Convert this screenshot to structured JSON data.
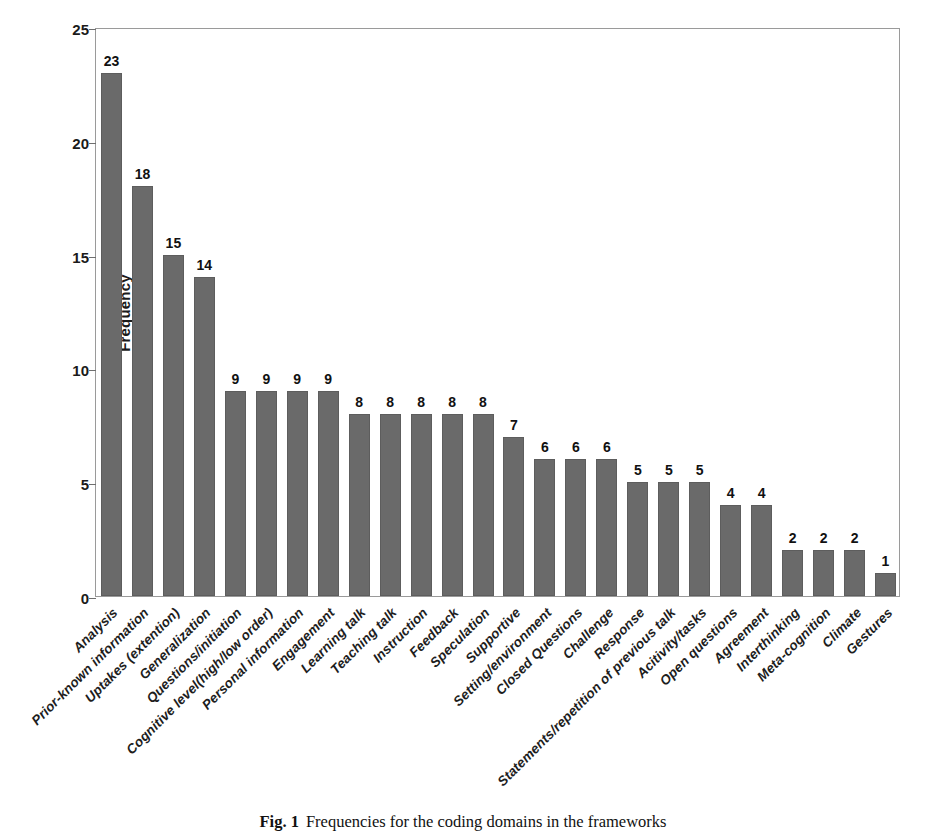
{
  "figure": {
    "caption_label": "Fig. 1",
    "caption_text": "Frequencies for the coding domains in the frameworks"
  },
  "colors": {
    "bar_fill": "#6a6a6a",
    "bar_stroke": "#5d5d5d",
    "frame": "#9a9a9a",
    "text": "#1b1b1b",
    "background": "#ffffff"
  },
  "chart_data": {
    "type": "bar",
    "title": "",
    "xlabel": "",
    "ylabel": "Frequency",
    "ylim": [
      0,
      25
    ],
    "yticks": [
      0,
      5,
      10,
      15,
      20,
      25
    ],
    "grid": false,
    "legend": null,
    "categories": [
      "Analysis",
      "Prior-known information",
      "Uptakes (extention)",
      "Generalization",
      "Questions/initiation",
      "Cognitive level(high/low order)",
      "Personal information",
      "Engagement",
      "Learning talk",
      "Teaching talk",
      "Instruction",
      "Feedback",
      "Speculation",
      "Supportive",
      "Setting/environment",
      "Closed Questions",
      "Challenge",
      "Response",
      "Statements/repetition of previous talk",
      "Acitivity/tasks",
      "Open questions",
      "Agreement",
      "Interthinking",
      "Meta-cognition",
      "Climate",
      "Gestures"
    ],
    "values": [
      23,
      18,
      15,
      14,
      9,
      9,
      9,
      9,
      8,
      8,
      8,
      8,
      8,
      7,
      6,
      6,
      6,
      5,
      5,
      5,
      4,
      4,
      2,
      2,
      2,
      1
    ]
  }
}
